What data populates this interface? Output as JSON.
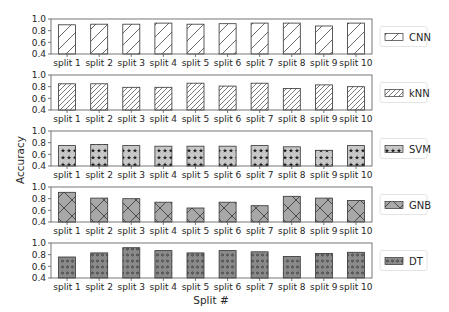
{
  "chart_data": {
    "type": "bar",
    "layout": "5 vertically stacked subplots, shared x categories, one legend per subplot on the right",
    "categories": [
      "split 1",
      "split 2",
      "split 3",
      "split 4",
      "split 5",
      "split 6",
      "split 7",
      "split 8",
      "split 9",
      "split 10"
    ],
    "xlabel": "Split #",
    "ylabel": "Accuracy",
    "ylim": [
      0.4,
      1.0
    ],
    "yticks": [
      "0.4",
      "0.6",
      "0.8",
      "1.0"
    ],
    "grid": false,
    "legend_position": "right of each subplot",
    "series": [
      {
        "name": "CNN",
        "fill": "#ffffff",
        "hatch": "diagonal",
        "values": [
          0.9,
          0.91,
          0.91,
          0.93,
          0.91,
          0.92,
          0.93,
          0.93,
          0.88,
          0.93
        ]
      },
      {
        "name": "kNN",
        "fill": "#ffffff",
        "hatch": "dense-diagonal",
        "values": [
          0.85,
          0.85,
          0.79,
          0.79,
          0.86,
          0.81,
          0.86,
          0.77,
          0.83,
          0.8
        ]
      },
      {
        "name": "SVM",
        "fill": "#c8c8c8",
        "hatch": "stars",
        "values": [
          0.75,
          0.77,
          0.75,
          0.74,
          0.74,
          0.74,
          0.75,
          0.73,
          0.67,
          0.75
        ]
      },
      {
        "name": "GNB",
        "fill": "#a8a8a8",
        "hatch": "crosshatch",
        "values": [
          0.91,
          0.81,
          0.8,
          0.74,
          0.64,
          0.74,
          0.68,
          0.84,
          0.81,
          0.77
        ]
      },
      {
        "name": "DT",
        "fill": "#8a8a8a",
        "hatch": "circles",
        "values": [
          0.76,
          0.83,
          0.92,
          0.87,
          0.83,
          0.87,
          0.85,
          0.77,
          0.82,
          0.84
        ]
      }
    ]
  }
}
